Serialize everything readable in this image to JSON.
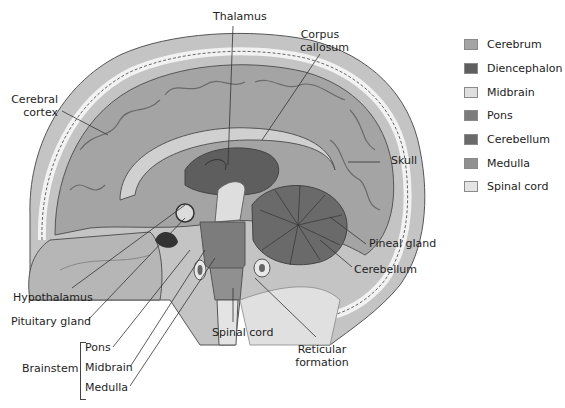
{
  "labels": {
    "thalamus": "Thalamus",
    "corpus_callosum_1": "Corpus",
    "corpus_callosum_2": "callosum",
    "cerebral_cortex_1": "Cerebral",
    "cerebral_cortex_2": "cortex",
    "skull": "Skull",
    "pineal_gland": "Pineal gland",
    "cerebellum": "Cerebellum",
    "hypothalamus": "Hypothalamus",
    "pituitary_gland": "Pituitary gland",
    "spinal_cord": "Spinal cord",
    "reticular_formation_1": "Reticular",
    "reticular_formation_2": "formation",
    "brainstem": "Brainstem",
    "pons": "Pons",
    "midbrain": "Midbrain",
    "medulla": "Medulla"
  },
  "legend": [
    {
      "label": "Cerebrum",
      "color": "#a4a4a4"
    },
    {
      "label": "Diencephalon",
      "color": "#5e5e5e"
    },
    {
      "label": "Midbrain",
      "color": "#dedede"
    },
    {
      "label": "Pons",
      "color": "#7c7c7c"
    },
    {
      "label": "Cerebellum",
      "color": "#6a6a6a"
    },
    {
      "label": "Medulla",
      "color": "#909090"
    },
    {
      "label": "Spinal cord",
      "color": "#e4e4e4"
    }
  ]
}
